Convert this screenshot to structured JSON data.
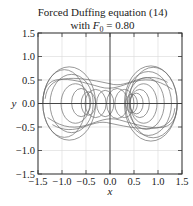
{
  "chart_data": {
    "type": "line",
    "title": "Forced Duffing equation (14)",
    "subtitle": "with F0 = 0.80",
    "subtitle_parts": {
      "prefix": "with ",
      "var": "F",
      "sub": "0",
      "suffix": " = 0.80"
    },
    "xlabel": "x",
    "ylabel": "y",
    "xlim": [
      -1.5,
      1.5
    ],
    "ylim": [
      -1.5,
      1.5
    ],
    "xticks": [
      "−1.5",
      "−1.0",
      "−0.5",
      "0.0",
      "0.5",
      "1.0",
      "1.5"
    ],
    "yticks": [
      "−1.5",
      "−1.0",
      "−0.5",
      "0.0",
      "0.5",
      "1.0",
      "1.5"
    ],
    "grid": true,
    "zero_lines": true,
    "series": [
      {
        "name": "phase trajectory (x, y)",
        "description": "chaotic phase-plane trajectory; left lobe loops centered near x≈-0.9, right lobe loops centered near x≈0.9; envelope x∈[-1.4,1.4], y∈[-0.8,0.8]",
        "envelope": {
          "x": [
            -1.4,
            1.4
          ],
          "y": [
            -0.8,
            0.8
          ]
        }
      }
    ],
    "colors": {
      "curve": "#6b6b6b",
      "frame": "#333333",
      "grid": "#d8d8d8"
    }
  }
}
